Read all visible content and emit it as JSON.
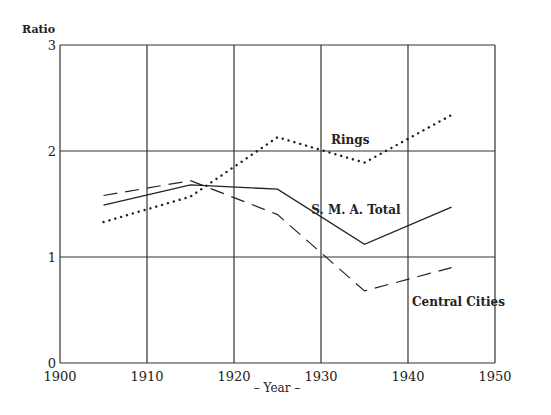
{
  "chart_data": {
    "type": "line",
    "title": "",
    "xlabel": "– Year –",
    "ylabel": "Ratio",
    "xlim": [
      1900,
      1950
    ],
    "ylim": [
      0,
      3
    ],
    "x_ticks": [
      1900,
      1910,
      1920,
      1930,
      1940,
      1950
    ],
    "y_ticks": [
      0,
      1,
      2,
      3
    ],
    "grid": true,
    "legend": "inline labels",
    "x": [
      1905,
      1915,
      1925,
      1935,
      1945
    ],
    "series": [
      {
        "name": "Rings",
        "style": "dotted",
        "values": [
          1.33,
          1.57,
          2.13,
          1.89,
          2.34
        ],
        "label_pos": [
          1926,
          1.83
        ]
      },
      {
        "name": "S. M. A. Total",
        "style": "solid",
        "values": [
          1.49,
          1.68,
          1.64,
          1.12,
          1.47
        ],
        "label_pos": [
          1931,
          1.4
        ]
      },
      {
        "name": "Central Cities",
        "style": "dashed",
        "values": [
          1.58,
          1.72,
          1.4,
          0.68,
          0.9
        ],
        "label_pos": [
          1937,
          0.53
        ]
      }
    ]
  },
  "labels": {
    "ylabel": "Ratio",
    "xlabel": "– Year –",
    "rings": "Rings",
    "sma": "S. M. A. Total",
    "central": "Central Cities"
  }
}
